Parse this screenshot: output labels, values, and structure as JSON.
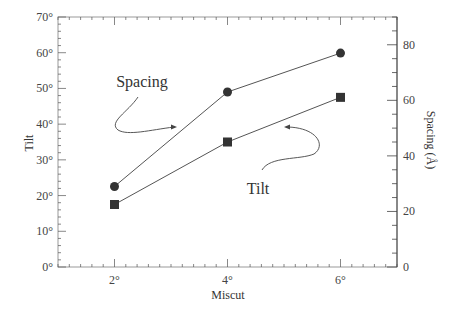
{
  "chart_data": {
    "type": "line",
    "title": "",
    "xlabel": "Miscut",
    "ylabel": "Tilt",
    "y2label": "Spacing (Å)",
    "x": [
      2,
      4,
      6
    ],
    "x_tick_labels": [
      "2°",
      "4°",
      "6°"
    ],
    "xlim": [
      1,
      7
    ],
    "ylim": [
      0,
      70
    ],
    "y_tick_labels": [
      "0°",
      "10°",
      "20°",
      "30°",
      "40°",
      "50°",
      "60°",
      "70°"
    ],
    "y2lim": [
      0,
      90
    ],
    "y2_tick_labels": [
      "0",
      "20",
      "40",
      "60",
      "80"
    ],
    "grid": false,
    "legend": "none",
    "series": [
      {
        "name": "Spacing",
        "axis": "right",
        "marker": "circle",
        "values": [
          29,
          63,
          77
        ]
      },
      {
        "name": "Tilt",
        "axis": "left",
        "marker": "square",
        "values": [
          17.5,
          35,
          47.5
        ]
      }
    ],
    "annotations": [
      {
        "text": "Spacing",
        "points_to": "circle series"
      },
      {
        "text": "Tilt",
        "points_to": "square series"
      }
    ]
  }
}
